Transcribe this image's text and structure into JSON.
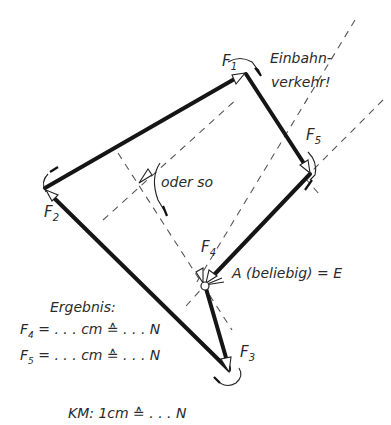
{
  "diagram": {
    "type": "force-polygon (Krafteck)",
    "labels": {
      "f1": "F",
      "f1_sub": "1",
      "f2": "F",
      "f2_sub": "2",
      "f3": "F",
      "f3_sub": "3",
      "f4": "F",
      "f4_sub": "4",
      "f5": "F",
      "f5_sub": "5",
      "one_way_line1": "Einbahn-",
      "one_way_line2": "verkehr!",
      "alternative": "oder so",
      "start_point": "A (beliebig) = E"
    },
    "result": {
      "title": "Ergebnis:",
      "f4_line": {
        "name": "F",
        "sub": "4",
        "text": " = . . . cm ≙ . . . N"
      },
      "f5_line": {
        "name": "F",
        "sub": "5",
        "text": " = . . . cm ≙ . . . N"
      }
    },
    "scale": "KM: 1cm ≙ . . . N",
    "colors": {
      "ink": "#151515",
      "dashed": "#555555",
      "background": "#ffffff"
    }
  }
}
